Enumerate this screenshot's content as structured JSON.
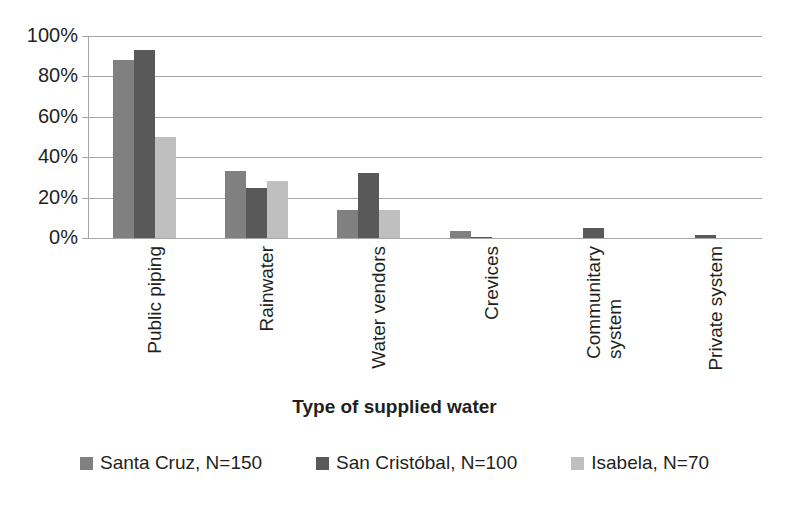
{
  "chart_data": {
    "type": "bar",
    "title": "",
    "xlabel": "Type of supplied water",
    "ylabel": "",
    "ylim": [
      0,
      100
    ],
    "ytick_labels": [
      "0%",
      "20%",
      "40%",
      "60%",
      "80%",
      "100%"
    ],
    "ytick_values": [
      0,
      20,
      40,
      60,
      80,
      100
    ],
    "grid": true,
    "legend_position": "bottom",
    "categories": [
      "Public piping",
      "Rainwater",
      "Water vendors",
      "Crevices",
      "Communitary\nsystem",
      "Private system"
    ],
    "series": [
      {
        "name": "Santa Cruz, N=150",
        "color": "#808080",
        "values": [
          88,
          33,
          14,
          3.5,
          0,
          0
        ]
      },
      {
        "name": "San Cristóbal, N=100",
        "color": "#595959",
        "values": [
          93,
          25,
          32,
          0.7,
          5,
          1.5
        ]
      },
      {
        "name": "Isabela, N=70",
        "color": "#bfbfbf",
        "values": [
          50,
          28,
          14,
          0,
          0,
          0
        ]
      }
    ]
  },
  "axis": {
    "x_title": "Type of supplied water"
  }
}
